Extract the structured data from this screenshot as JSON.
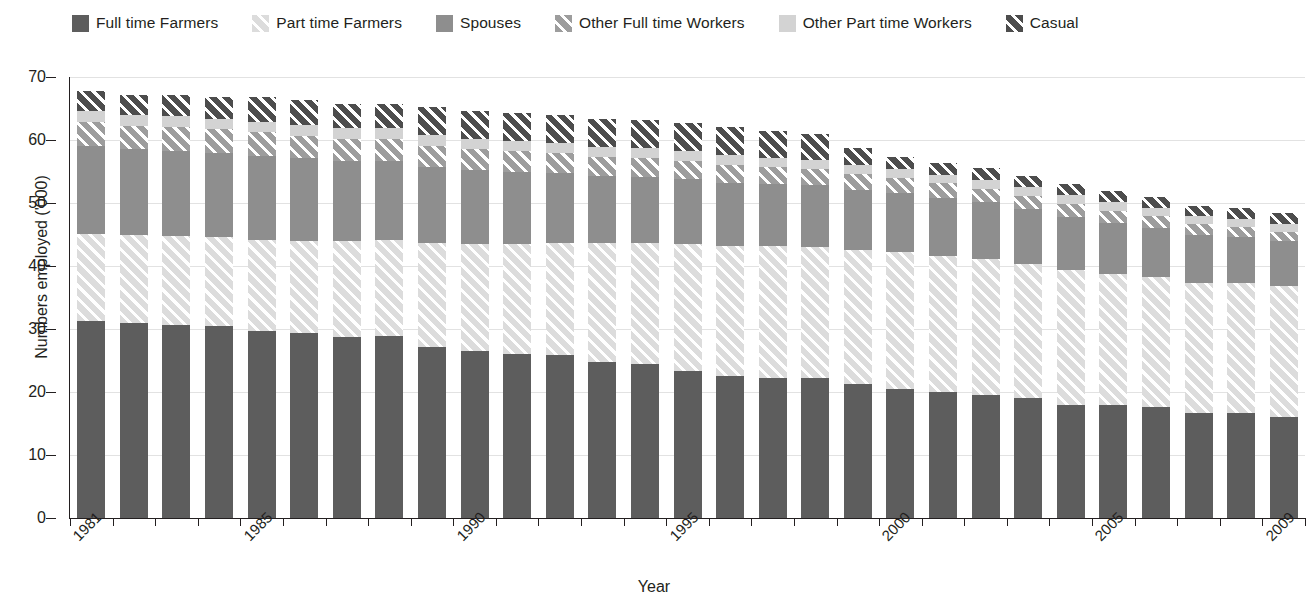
{
  "legend": {
    "position": "top",
    "items": [
      {
        "label": "Full time Farmers",
        "key": "ftf",
        "color": "#5d5d5d",
        "pattern": "solid"
      },
      {
        "label": "Part time Farmers",
        "key": "ptf",
        "color": "#dcdcdc",
        "pattern": "diagonal-hatch"
      },
      {
        "label": "Spouses",
        "key": "sp",
        "color": "#8e8e8e",
        "pattern": "solid"
      },
      {
        "label": "Other Full time Workers",
        "key": "oftw",
        "color": "#9d9d9d",
        "pattern": "diagonal-hatch"
      },
      {
        "label": "Other Part time Workers",
        "key": "optw",
        "color": "#d3d3d3",
        "pattern": "solid"
      },
      {
        "label": "Casual",
        "key": "cas",
        "color": "#4d4d4d",
        "pattern": "diagonal-hatch"
      }
    ]
  },
  "axes": {
    "ylabel": "Numbers employed ('000)",
    "xlabel": "Year",
    "yticks": [
      0,
      10,
      20,
      30,
      40,
      50,
      60,
      70
    ],
    "ylim": [
      0,
      70
    ],
    "xtick_labels_shown": [
      "1981",
      "1985",
      "1990",
      "1995",
      "2000",
      "2005",
      "2009"
    ],
    "grid": "horizontal"
  },
  "chart_data": {
    "type": "bar",
    "subtype": "stacked",
    "title": "",
    "xlabel": "Year",
    "ylabel": "Numbers employed ('000)",
    "ylim": [
      0,
      70
    ],
    "yticks": [
      0,
      10,
      20,
      30,
      40,
      50,
      60,
      70
    ],
    "grid": true,
    "legend_position": "top",
    "categories": [
      "1981",
      "1982",
      "1983",
      "1984",
      "1985",
      "1986",
      "1987",
      "1988",
      "1989",
      "1990",
      "1991",
      "1992",
      "1993",
      "1994",
      "1995",
      "1996",
      "1997",
      "1998",
      "1999",
      "2000",
      "2001",
      "2002",
      "2003",
      "2004",
      "2005",
      "2006",
      "2007",
      "2008",
      "2009"
    ],
    "xtick_labels_shown": [
      "1981",
      "1985",
      "1990",
      "1995",
      "2000",
      "2005",
      "2009"
    ],
    "series": [
      {
        "name": "Full time Farmers",
        "values": [
          31.2,
          31.0,
          30.6,
          30.5,
          29.7,
          29.4,
          28.8,
          28.9,
          27.1,
          26.5,
          26.0,
          25.8,
          24.7,
          24.5,
          23.4,
          22.6,
          22.3,
          22.3,
          21.3,
          20.5,
          20.0,
          19.5,
          19.0,
          18.0,
          17.9,
          17.7,
          16.7,
          16.6,
          16.1
        ]
      },
      {
        "name": "Part time Farmers",
        "values": [
          13.9,
          13.9,
          14.1,
          14.1,
          14.5,
          14.6,
          15.1,
          15.2,
          16.5,
          17.0,
          17.5,
          17.8,
          18.9,
          19.2,
          20.1,
          20.5,
          20.8,
          20.7,
          21.2,
          21.7,
          21.6,
          21.6,
          21.3,
          21.3,
          20.8,
          20.5,
          20.6,
          20.7,
          20.8
        ]
      },
      {
        "name": "Spouses",
        "values": [
          13.9,
          13.6,
          13.6,
          13.4,
          13.3,
          13.1,
          12.8,
          12.6,
          12.1,
          11.7,
          11.5,
          11.2,
          10.7,
          10.5,
          10.3,
          10.1,
          9.9,
          9.8,
          9.6,
          9.4,
          9.2,
          9.0,
          8.7,
          8.5,
          8.2,
          7.9,
          7.6,
          7.3,
          7.0
        ]
      },
      {
        "name": "Other Full time Workers",
        "values": [
          3.9,
          3.8,
          3.8,
          3.7,
          3.7,
          3.6,
          3.5,
          3.5,
          3.4,
          3.3,
          3.2,
          3.1,
          3.0,
          3.0,
          2.9,
          2.8,
          2.7,
          2.6,
          2.5,
          2.4,
          2.3,
          2.2,
          2.1,
          2.0,
          1.9,
          1.8,
          1.7,
          1.6,
          1.5
        ]
      },
      {
        "name": "Other Part time Workers",
        "values": [
          1.7,
          1.7,
          1.7,
          1.7,
          1.7,
          1.7,
          1.7,
          1.7,
          1.7,
          1.6,
          1.6,
          1.6,
          1.6,
          1.6,
          1.6,
          1.6,
          1.5,
          1.5,
          1.5,
          1.4,
          1.4,
          1.4,
          1.4,
          1.4,
          1.3,
          1.3,
          1.3,
          1.3,
          1.3
        ]
      },
      {
        "name": "Casual",
        "values": [
          3.2,
          3.1,
          3.3,
          3.5,
          3.9,
          3.9,
          3.9,
          3.9,
          4.5,
          4.5,
          4.5,
          4.4,
          4.4,
          4.4,
          4.4,
          4.4,
          4.3,
          4.1,
          2.7,
          1.9,
          1.8,
          1.8,
          1.8,
          1.8,
          1.8,
          1.8,
          1.7,
          1.7,
          1.7
        ]
      }
    ],
    "totals": [
      67.8,
      67.1,
      67.1,
      66.9,
      66.8,
      66.3,
      65.8,
      65.8,
      65.3,
      64.6,
      64.3,
      63.9,
      63.3,
      63.2,
      62.7,
      62.0,
      61.5,
      61.0,
      58.8,
      57.3,
      56.3,
      55.5,
      54.3,
      53.0,
      51.9,
      51.0,
      49.6,
      49.2,
      48.4
    ]
  }
}
